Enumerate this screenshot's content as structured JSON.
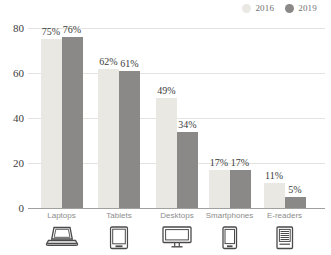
{
  "chart_data": {
    "type": "bar",
    "title": "",
    "xlabel": "",
    "ylabel": "",
    "categories": [
      "Laptops",
      "Tablets",
      "Desktops",
      "Smartphones",
      "E-readers"
    ],
    "category_icons": [
      "laptop-icon",
      "tablet-icon",
      "desktop-icon",
      "smartphone-icon",
      "ereader-icon"
    ],
    "series": [
      {
        "name": "2016",
        "color": "#e9e8e3",
        "values": [
          75,
          62,
          49,
          17,
          11
        ]
      },
      {
        "name": "2019",
        "color": "#8b8987",
        "values": [
          76,
          61,
          34,
          17,
          5
        ]
      }
    ],
    "value_labels": [
      [
        "75%",
        "62%",
        "49%",
        "17%",
        "11%"
      ],
      [
        "76%",
        "61%",
        "34%",
        "17%",
        "5%"
      ]
    ],
    "yticks": [
      "0",
      "20",
      "40",
      "60",
      "80"
    ],
    "ylim": [
      0,
      80
    ],
    "grid": true,
    "legend_position": "top-right"
  },
  "colors": {
    "background": "#ffffff",
    "gridline": "#e4e3e0",
    "axis": "#a0a09e",
    "value_label": "#3b3b3b",
    "tick_label": "#404040",
    "category_label": "#8d8d8d",
    "legend_label": "#707070",
    "icon_stroke": "#4a4a4a"
  }
}
